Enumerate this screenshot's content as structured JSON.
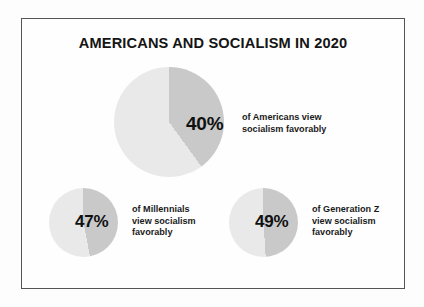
{
  "chart_data": {
    "type": "pie",
    "title": "AMERICANS AND SOCIALISM IN 2020",
    "xlabel": "",
    "ylabel": "",
    "legend": "none",
    "grid": false,
    "charts": [
      {
        "id": "americans",
        "value": 40,
        "value_label": "40%",
        "remainder": 60,
        "caption_lines": [
          "of Americans view",
          "socialism favorably"
        ],
        "slice_color": "#c9c9c9",
        "rest_color": "#e9e9e9"
      },
      {
        "id": "millennials",
        "value": 47,
        "value_label": "47%",
        "remainder": 53,
        "caption_lines": [
          "of Millennials",
          "view socialism",
          "favorably"
        ],
        "slice_color": "#c9c9c9",
        "rest_color": "#e9e9e9"
      },
      {
        "id": "genz",
        "value": 49,
        "value_label": "49%",
        "remainder": 51,
        "caption_lines": [
          "of Generation Z",
          "view socialism",
          "favorably"
        ],
        "slice_color": "#c9c9c9",
        "rest_color": "#e9e9e9"
      }
    ]
  },
  "infographic": {
    "title": "AMERICANS AND SOCIALISM IN 2020",
    "frame_color": "#555555",
    "background_color": "#fefefe"
  },
  "pies": {
    "americans": {
      "percent": "40%",
      "caption_line1": "of Americans view",
      "caption_line2": "socialism favorably",
      "caption_line3": ""
    },
    "millennials": {
      "percent": "47%",
      "caption_line1": "of Millennials",
      "caption_line2": "view socialism",
      "caption_line3": "favorably"
    },
    "genz": {
      "percent": "49%",
      "caption_line1": "of Generation Z",
      "caption_line2": "view socialism",
      "caption_line3": "favorably"
    }
  }
}
